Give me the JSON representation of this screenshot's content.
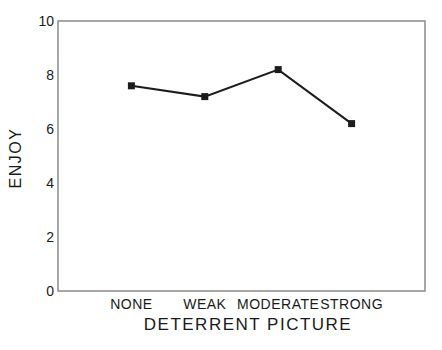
{
  "chart_data": {
    "type": "line",
    "title": "",
    "xlabel": "DETERRENT PICTURE",
    "ylabel": "ENJOY",
    "categories": [
      "NONE",
      "WEAK",
      "MODERATE",
      "STRONG"
    ],
    "values": [
      7.6,
      7.2,
      8.2,
      6.2
    ],
    "ylim": [
      0,
      10
    ],
    "yticks": [
      0,
      2,
      4,
      6,
      8,
      10
    ],
    "legend": null,
    "grid": false,
    "marker": "filled-square",
    "line_color": "#1c1c1c",
    "marker_color": "#1c1c1c",
    "frame_color": "#8a8a8a",
    "text_color": "#1a1a1a",
    "background_color": "#ffffff"
  }
}
